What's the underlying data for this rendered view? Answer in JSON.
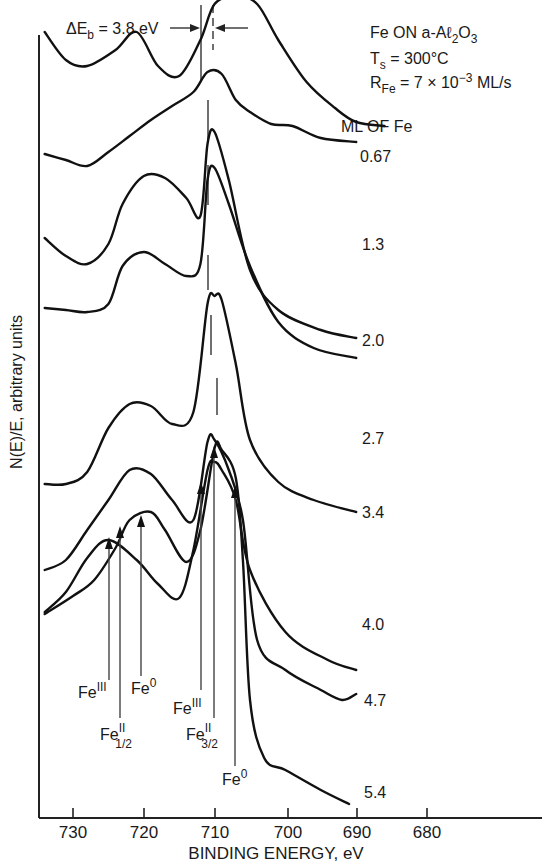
{
  "chart_data": {
    "type": "line",
    "title": "Fe ON a-Aℓ2O3",
    "conditions": [
      "Fe ON a-Aℓ2O3",
      "Ts = 300°C",
      "RFe = 7 × 10^-3 ML/s"
    ],
    "xlabel": "BINDING ENERGY, eV",
    "ylabel": "N(E)/E, arbitrary units",
    "xlim": [
      734,
      680
    ],
    "x_reversed": true,
    "xticks": [
      730,
      720,
      710,
      700,
      690,
      680
    ],
    "grid": false,
    "legend_title": "ML OF Fe",
    "delta_eb_annotation": "ΔEb = 3.8 eV",
    "series": [
      {
        "name": "0.67 ML",
        "label": "0.67",
        "peak_eV": 711.2,
        "points": [
          [
            734,
            212
          ],
          [
            731,
            240
          ],
          [
            728,
            246
          ],
          [
            724,
            230
          ],
          [
            721,
            212
          ],
          [
            718,
            246
          ],
          [
            715,
            256
          ],
          [
            712,
            220
          ],
          [
            710,
            184
          ],
          [
            707,
            176
          ],
          [
            704,
            184
          ],
          [
            701,
            220
          ],
          [
            697,
            262
          ],
          [
            693,
            288
          ],
          [
            690,
            302
          ],
          [
            686,
            306
          ]
        ]
      },
      {
        "name": "1.3 ML",
        "label": "1.3",
        "peak_eV": 710.8,
        "points": [
          [
            734,
            114
          ],
          [
            731,
            120
          ],
          [
            728,
            126
          ],
          [
            725,
            112
          ],
          [
            722,
            96
          ],
          [
            719,
            80
          ],
          [
            716,
            66
          ],
          [
            713,
            52
          ],
          [
            711,
            32
          ],
          [
            709,
            34
          ],
          [
            707,
            60
          ],
          [
            705,
            72
          ],
          [
            702,
            84
          ],
          [
            699,
            86
          ],
          [
            695,
            98
          ],
          [
            690,
            102
          ]
        ]
      },
      {
        "name": "2.0 ML",
        "label": "2.0",
        "peak_eV": 710.8,
        "points": [
          [
            734,
            198
          ],
          [
            731,
            216
          ],
          [
            728,
            224
          ],
          [
            725,
            204
          ],
          [
            723,
            164
          ],
          [
            720,
            136
          ],
          [
            717,
            138
          ],
          [
            714,
            158
          ],
          [
            712,
            176
          ],
          [
            711,
            104
          ],
          [
            710,
            92
          ],
          [
            708,
            140
          ],
          [
            705,
            230
          ],
          [
            701,
            270
          ],
          [
            695,
            290
          ],
          [
            690,
            298
          ]
        ]
      },
      {
        "name": "2.7 ML",
        "label": "2.7",
        "peak_eV": 710.2,
        "points": [
          [
            734,
            268
          ],
          [
            731,
            270
          ],
          [
            728,
            272
          ],
          [
            725,
            264
          ],
          [
            723,
            226
          ],
          [
            720,
            212
          ],
          [
            717,
            224
          ],
          [
            714,
            236
          ],
          [
            712,
            224
          ],
          [
            711,
            140
          ],
          [
            710,
            128
          ],
          [
            708,
            164
          ],
          [
            705,
            226
          ],
          [
            701,
            282
          ],
          [
            696,
            308
          ],
          [
            690,
            318
          ]
        ]
      },
      {
        "name": "3.4 ML",
        "label": "3.4",
        "peak_eV": 710.0,
        "points": [
          [
            734,
            284
          ],
          [
            731,
            284
          ],
          [
            728,
            272
          ],
          [
            725,
            228
          ],
          [
            722,
            204
          ],
          [
            719,
            206
          ],
          [
            716,
            224
          ],
          [
            713,
            212
          ],
          [
            711,
            104
          ],
          [
            710,
            96
          ],
          [
            709,
            100
          ],
          [
            707,
            164
          ],
          [
            705,
            240
          ],
          [
            701,
            282
          ],
          [
            696,
            300
          ],
          [
            690,
            312
          ]
        ]
      },
      {
        "name": "4.0 ML",
        "label": "4.0",
        "peak_eV": 709.8,
        "points": [
          [
            734,
            372
          ],
          [
            731,
            352
          ],
          [
            728,
            318
          ],
          [
            725,
            300
          ],
          [
            721,
            320
          ],
          [
            718,
            344
          ],
          [
            715,
            358
          ],
          [
            713,
            310
          ],
          [
            711,
            230
          ],
          [
            710,
            222
          ],
          [
            709,
            230
          ],
          [
            707,
            260
          ],
          [
            705,
            330
          ],
          [
            700,
            392
          ],
          [
            694,
            420
          ],
          [
            690,
            430
          ]
        ]
      },
      {
        "name": "4.7 ML",
        "label": "4.7",
        "peak_eV": 710.0,
        "points": [
          [
            734,
            570
          ],
          [
            731,
            560
          ],
          [
            728,
            530
          ],
          [
            725,
            500
          ],
          [
            722,
            470
          ],
          [
            719,
            474
          ],
          [
            716,
            500
          ],
          [
            713,
            520
          ],
          [
            711,
            442
          ],
          [
            710,
            440
          ],
          [
            708,
            470
          ],
          [
            706,
            520
          ],
          [
            704,
            640
          ],
          [
            700,
            670
          ],
          [
            695,
            690
          ],
          [
            692,
            700
          ],
          [
            690,
            694
          ]
        ]
      },
      {
        "name": "5.4 ML",
        "label": "5.4",
        "peak_eV": 710.0,
        "points": [
          [
            734,
            614
          ],
          [
            730,
            596
          ],
          [
            727,
            580
          ],
          [
            724,
            548
          ],
          [
            722,
            520
          ],
          [
            719,
            512
          ],
          [
            717,
            530
          ],
          [
            714,
            562
          ],
          [
            712,
            530
          ],
          [
            710,
            448
          ],
          [
            709,
            450
          ],
          [
            707,
            478
          ],
          [
            706,
            560
          ],
          [
            705,
            700
          ],
          [
            703,
            758
          ],
          [
            700,
            770
          ],
          [
            695,
            790
          ],
          [
            691,
            804
          ]
        ]
      }
    ],
    "peak_annotations": [
      {
        "label": "Fe",
        "sup": "III",
        "sub": "",
        "eV": 725.5
      },
      {
        "label": "Fe",
        "sup": "II",
        "sub": "1/2",
        "eV": 723.5
      },
      {
        "label": "Fe",
        "sup": "0",
        "sub": "",
        "eV": 720.5
      },
      {
        "label": "Fe",
        "sup": "III",
        "sub": "",
        "eV": 712.0
      },
      {
        "label": "Fe",
        "sup": "II",
        "sub": "3/2",
        "eV": 710.2
      },
      {
        "label": "Fe",
        "sup": "0",
        "sub": "",
        "eV": 707.2
      }
    ],
    "reference_lines_eV": {
      "solid": 711.7,
      "dashed": 710.0
    }
  },
  "text": {
    "delta_prefix": "ΔE",
    "delta_sub": "b",
    "delta_value": " = 3.8 eV",
    "cond1_main": "Fe ON a-Aℓ",
    "cond1_sub2": "2",
    "cond1_o": "O",
    "cond1_sub3": "3",
    "cond2_main": "T",
    "cond2_sub": "s",
    "cond2_rest": " = 300°C",
    "cond3_main": "R",
    "cond3_sub": "Fe",
    "cond3_rest": " = 7 × 10",
    "cond3_exp": "−3",
    "cond3_unit": " ML/s",
    "legend_title": "ML OF Fe",
    "curve_labels": [
      "0.67",
      "1.3",
      "2.0",
      "2.7",
      "3.4",
      "4.0",
      "4.7",
      "5.4"
    ],
    "xticks": [
      "730",
      "720",
      "710",
      "700",
      "690",
      "680"
    ],
    "xlabel": "BINDING ENERGY, eV",
    "ylabel": "N(E)/E, arbitrary units",
    "fe": "Fe",
    "sup_III": "III",
    "sup_II": "II",
    "sup_0": "0",
    "sub_12": "1/2",
    "sub_32": "3/2"
  }
}
